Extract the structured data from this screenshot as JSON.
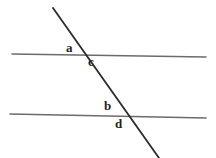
{
  "figure": {
    "canvas": {
      "width": 216,
      "height": 158,
      "background": "#ffffff"
    },
    "colors": {
      "parallel_line": "#6b6b6b",
      "transversal_line": "#2e2a2b",
      "label_text": "#231f20",
      "background": "#ffffff"
    },
    "lines": [
      {
        "name": "upper-parallel-line",
        "role": "parallel",
        "x1": 12,
        "y1": 54,
        "x2": 206,
        "y2": 57,
        "stroke": "#6b6b6b",
        "stroke_width": 1.6
      },
      {
        "name": "lower-parallel-line",
        "role": "parallel",
        "x1": 10,
        "y1": 114,
        "x2": 206,
        "y2": 118,
        "stroke": "#6b6b6b",
        "stroke_width": 1.6
      },
      {
        "name": "transversal-line",
        "role": "transversal",
        "x1": 53,
        "y1": 8,
        "x2": 159,
        "y2": 158,
        "stroke": "#2e2a2b",
        "stroke_width": 1.8
      }
    ],
    "intersections": [
      {
        "name": "upper-intersection",
        "x": 82,
        "y": 55
      },
      {
        "name": "lower-intersection",
        "x": 127,
        "y": 116
      }
    ],
    "labels": [
      {
        "id": "a",
        "text": "a",
        "x": 66,
        "y": 41,
        "at": "upper-intersection",
        "position": "above-left"
      },
      {
        "id": "c",
        "text": "c",
        "x": 88,
        "y": 55,
        "at": "upper-intersection",
        "position": "below-right"
      },
      {
        "id": "b",
        "text": "b",
        "x": 104,
        "y": 99,
        "at": "lower-intersection",
        "position": "above-left"
      },
      {
        "id": "d",
        "text": "d",
        "x": 115,
        "y": 117,
        "at": "lower-intersection",
        "position": "below-right"
      }
    ]
  }
}
